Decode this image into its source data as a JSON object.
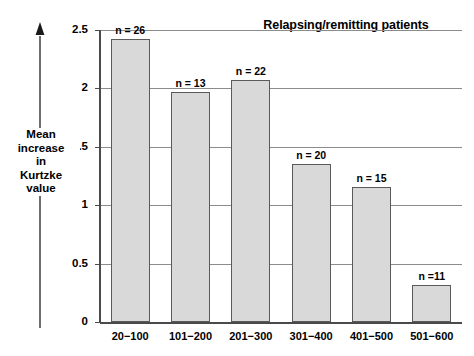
{
  "chart_data": {
    "type": "bar",
    "title": "Relapsing/remitting patients",
    "xlabel": "",
    "ylabel": "Mean increase in Kurtzke value",
    "categories": [
      "20−100",
      "101−200",
      "201−300",
      "301−400",
      "401−500",
      "501−600"
    ],
    "values": [
      2.42,
      1.97,
      2.07,
      1.35,
      1.16,
      0.32
    ],
    "annotations": [
      "n = 26",
      "n = 13",
      "n = 22",
      "n = 20",
      "n = 15",
      "n =11"
    ],
    "counts": [
      26,
      13,
      22,
      20,
      15,
      11
    ],
    "ylim": [
      0,
      2.5
    ],
    "yticks": [
      "0",
      "0.5",
      "1",
      "1.5",
      "2",
      "2.5"
    ],
    "ytick_values": [
      0,
      0.5,
      1,
      1.5,
      2,
      2.5
    ],
    "grid": true,
    "legend": "none",
    "bar_color": "#d9d9d9",
    "bar_edge_color": "#5a5a5a",
    "gridline_color": "#8c8c8c",
    "axis_color": "#4a4a4a"
  },
  "axis": {
    "caption_lines": [
      "Mean",
      "increase",
      "in",
      "Kurtzke",
      "value"
    ],
    "arrow_icon": "up-arrow-icon"
  }
}
